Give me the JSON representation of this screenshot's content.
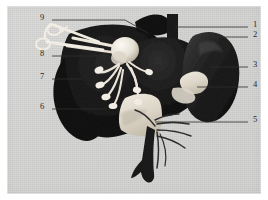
{
  "figure": {
    "kind": "anatomical-specimen-photograph",
    "plate_color": "#d3d3d2",
    "border_color": "#ffffff",
    "ink_color": "#2a2a2a",
    "specimen_dark": "#111111",
    "specimen_light": "#e8e4dc",
    "width": 268,
    "height": 200
  },
  "callouts": {
    "right": [
      {
        "id": "1",
        "label": "1",
        "x": 246,
        "y": 18,
        "line_from_x": 168,
        "line_to_x": 241,
        "line_y": 21
      },
      {
        "id": "2",
        "label": "2",
        "x": 246,
        "y": 28,
        "line_from_x": 205,
        "line_to_x": 241,
        "line_y": 31
      },
      {
        "id": "3",
        "label": "3",
        "x": 246,
        "y": 58,
        "line_from_x": 203,
        "line_to_x": 241,
        "line_y": 61
      },
      {
        "id": "4",
        "label": "4",
        "x": 246,
        "y": 78,
        "line_from_x": 190,
        "line_to_x": 241,
        "line_y": 81
      },
      {
        "id": "5",
        "label": "5",
        "x": 246,
        "y": 113,
        "line_from_x": 148,
        "line_to_x": 241,
        "line_y": 116
      }
    ],
    "left": [
      {
        "id": "9",
        "label": "9",
        "x": 36,
        "y": 11,
        "line_from_x": 45,
        "line_to_x": 118,
        "line_y": 14
      },
      {
        "id": "8",
        "label": "8",
        "x": 36,
        "y": 47,
        "line_from_x": 45,
        "line_to_x": 100,
        "line_y": 50
      },
      {
        "id": "7",
        "label": "7",
        "x": 36,
        "y": 70,
        "line_from_x": 45,
        "line_to_x": 75,
        "line_y": 73
      },
      {
        "id": "6",
        "label": "6",
        "x": 36,
        "y": 100,
        "line_from_x": 45,
        "line_to_x": 100,
        "line_y": 103
      }
    ]
  }
}
